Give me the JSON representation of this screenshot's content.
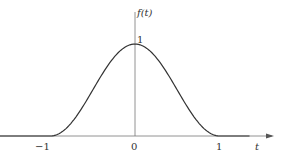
{
  "chart_data": {
    "type": "line",
    "title": "",
    "xlabel": "t",
    "ylabel": "f(t)",
    "x_ticks": [
      "-1",
      "0",
      "1"
    ],
    "y_ticks": [
      "1"
    ],
    "xlim": [
      -1.6,
      1.6
    ],
    "ylim": [
      0,
      1.1
    ],
    "grid": false,
    "legend": null,
    "series": [
      {
        "name": "f(t)",
        "description": "raised cosine pulse: (1+cos(pi t))/2 for |t|<=1, 0 otherwise",
        "x": [
          -1.5,
          -1.0,
          -0.75,
          -0.5,
          -0.25,
          0.0,
          0.25,
          0.5,
          0.75,
          1.0,
          1.5
        ],
        "values": [
          0,
          0,
          0.146,
          0.5,
          0.854,
          1.0,
          0.854,
          0.5,
          0.146,
          0,
          0
        ]
      }
    ]
  },
  "labels": {
    "y_axis": "f(t)",
    "x_axis": "t",
    "tick_minus1": "−1",
    "tick_0": "0",
    "tick_1": "1",
    "peak": "1"
  },
  "colors": {
    "axis": "#666666",
    "curve": "#333333"
  }
}
